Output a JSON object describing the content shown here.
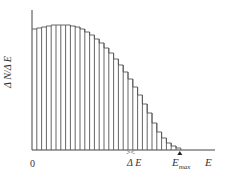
{
  "chart_data": {
    "type": "bar",
    "title": "",
    "xlabel": "E",
    "ylabel": "ΔN/ΔE",
    "x_tick_labels": [
      "0"
    ],
    "annotations": [
      "ΔE",
      "E_max"
    ],
    "grid": false,
    "legend": null,
    "bar_style": "histogram, outlined, no fill, ~5px bins of width ΔE",
    "categories": [
      "1",
      "2",
      "3",
      "4",
      "5",
      "6",
      "7",
      "8",
      "9",
      "10",
      "11",
      "12",
      "13",
      "14",
      "15",
      "16",
      "17",
      "18",
      "19",
      "20",
      "21",
      "22",
      "23",
      "24",
      "25",
      "26",
      "27",
      "28",
      "29",
      "30",
      "31"
    ],
    "values": [
      121,
      122,
      123,
      124,
      125,
      125,
      125,
      125,
      124,
      123,
      121,
      118,
      115,
      111,
      107,
      102,
      97,
      91,
      85,
      78,
      71,
      63,
      55,
      46,
      37,
      27,
      18,
      12,
      7,
      4,
      2
    ],
    "ylim": [
      0,
      140
    ],
    "units_note": "relative (unlabeled y axis)"
  },
  "labels": {
    "ylabel": "Δ N/Δ E",
    "zero": "0",
    "delta_e": "Δ E",
    "delta_e_marks": "> <",
    "emax_main": "E",
    "emax_sub": "max",
    "x_axis": "E"
  },
  "colors": {
    "line": "#555555",
    "axis": "#444444",
    "background": "#ffffff"
  }
}
